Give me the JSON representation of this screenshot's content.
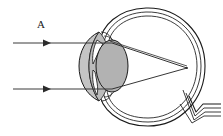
{
  "figure": {
    "background_color": "#ffffff",
    "width": 223,
    "height": 136
  },
  "labels": {
    "ray_bundle_label": "A"
  },
  "colors": {
    "outline": "#1a1a1a",
    "ray_line": "#3a3a3a",
    "lens_fill": "#b4b4b4",
    "cornea_fill": "#c8c8c8",
    "anterior_chamber_fill": "#bdbdbd",
    "iris_fill": "#ffffff",
    "globe_fill": "#ffffff"
  },
  "structures": [
    {
      "name": "sclera-outer-wall",
      "description": "outermost layer of the eye globe"
    },
    {
      "name": "choroid-layer",
      "description": "middle concentric layer of the eye globe"
    },
    {
      "name": "retina-layer",
      "description": "innermost concentric layer of the eye globe"
    },
    {
      "name": "cornea",
      "description": "gray crescent at the front of the eye"
    },
    {
      "name": "anterior-chamber",
      "description": "shaded region behind the cornea"
    },
    {
      "name": "lens",
      "description": "gray ellipse focusing the light"
    },
    {
      "name": "iris-upper",
      "description": "upper iris / ciliary body flap"
    },
    {
      "name": "iris-lower",
      "description": "lower iris / ciliary body flap"
    },
    {
      "name": "optic-nerve",
      "description": "nerve stub exiting the lower right of the globe"
    },
    {
      "name": "focal-point",
      "description": "point on the retina where rays converge"
    }
  ],
  "rays": {
    "count": 2,
    "direction": "left-to-right",
    "label": "A",
    "upper_ray": {
      "y": 43,
      "x_start": 13,
      "x_end": 112,
      "arrowhead_x": 47
    },
    "lower_ray": {
      "y": 89,
      "x_start": 13,
      "x_end": 112,
      "arrowhead_x": 47
    },
    "converge_at": {
      "x": 187,
      "y": 68
    }
  }
}
